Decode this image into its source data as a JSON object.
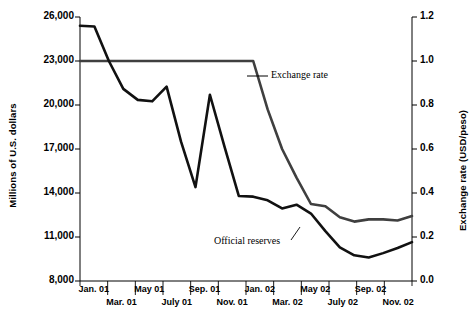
{
  "chart_data": {
    "type": "line",
    "title": "",
    "xlabel": "",
    "ylabel": "Millions of U.S. dollars",
    "y2label": "Exchange rate (USD/peso)",
    "x": [
      "Jan. 01",
      "Feb. 01",
      "Mar. 01",
      "Apr. 01",
      "May 01",
      "June 01",
      "July 01",
      "Aug. 01",
      "Sep. 01",
      "Oct. 01",
      "Nov. 01",
      "Dec. 01",
      "Jan. 02",
      "Feb. 02",
      "Mar. 02",
      "Apr. 02",
      "May 02",
      "June 02",
      "July 02",
      "Aug. 02",
      "Sep. 02",
      "Oct. 02",
      "Nov. 02",
      "Dec. 02"
    ],
    "xtick_labels_row1": [
      "Jan. 01",
      "May 01",
      "Sep. 01",
      "Jan. 02",
      "May 02",
      "Sep. 02"
    ],
    "xtick_labels_row2": [
      "Mar. 01",
      "July 01",
      "Nov. 01",
      "Mar. 02",
      "July 02",
      "Nov. 02"
    ],
    "ytick_labels": [
      "26,000",
      "23,000",
      "20,000",
      "17,000",
      "14,000",
      "11,000",
      "8,000"
    ],
    "ytick_values": [
      26000,
      23000,
      20000,
      17000,
      14000,
      11000,
      8000
    ],
    "ylim": [
      8000,
      26000
    ],
    "y2tick_labels": [
      "1.2",
      "1.0",
      "0.8",
      "0.6",
      "0.4",
      "0.2",
      "0.0"
    ],
    "y2tick_values": [
      1.2,
      1.0,
      0.8,
      0.6,
      0.4,
      0.2,
      0.0
    ],
    "y2lim": [
      0.0,
      1.2
    ],
    "grid": false,
    "legend": "annotations",
    "series": [
      {
        "name": "Official reserves",
        "axis": "left",
        "color": "#111111",
        "values": [
          25400,
          25350,
          23000,
          21100,
          20350,
          20250,
          21250,
          17500,
          14400,
          20700,
          17200,
          13800,
          13750,
          13500,
          12950,
          13200,
          12600,
          11400,
          10300,
          9750,
          9600,
          9900,
          10250,
          10650
        ]
      },
      {
        "name": "Exchange rate",
        "axis": "right",
        "color": "#3f3f3f",
        "values": [
          1.0,
          1.0,
          1.0,
          1.0,
          1.0,
          1.0,
          1.0,
          1.0,
          1.0,
          1.0,
          1.0,
          1.0,
          1.0,
          0.78,
          0.6,
          0.47,
          0.35,
          0.34,
          0.29,
          0.27,
          0.28,
          0.28,
          0.275,
          0.295
        ]
      }
    ],
    "annotations": [
      {
        "text": "Exchange rate",
        "series": "Exchange rate"
      },
      {
        "text": "Official reserves",
        "series": "Official reserves"
      }
    ]
  },
  "axis": {
    "left_title": "Millions of U.S. dollars",
    "right_title": "Exchange rate (USD/peso)"
  }
}
